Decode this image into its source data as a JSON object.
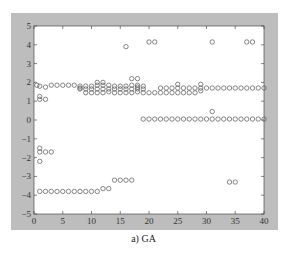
{
  "caption": "a) GA",
  "colors": {
    "panel": "#bdbdbd",
    "plot_bg": "#ffffff",
    "marker": "#555555",
    "axis": "#333333"
  },
  "chart_data": {
    "type": "scatter",
    "title": "",
    "caption": "a) GA",
    "xlabel": "",
    "ylabel": "",
    "xlim": [
      0,
      40
    ],
    "ylim": [
      -5,
      5
    ],
    "xticks": [
      0,
      5,
      10,
      15,
      20,
      25,
      30,
      35,
      40
    ],
    "yticks": [
      -5,
      -4,
      -3,
      -2,
      -1,
      0,
      1,
      2,
      3,
      4,
      5
    ],
    "grid": false,
    "legend": null,
    "marker": "open-circle",
    "series": [
      {
        "name": "upper-band-1.8",
        "points": [
          [
            0.5,
            1.85
          ],
          [
            1,
            1.8
          ],
          [
            2,
            1.75
          ],
          [
            3,
            1.85
          ],
          [
            4,
            1.85
          ],
          [
            5,
            1.85
          ],
          [
            6,
            1.85
          ],
          [
            7,
            1.85
          ],
          [
            8,
            1.8
          ],
          [
            8,
            1.7
          ],
          [
            9,
            1.8
          ],
          [
            10,
            1.8
          ],
          [
            11,
            1.85
          ],
          [
            11,
            2.0
          ],
          [
            12,
            2.0
          ],
          [
            12,
            1.85
          ],
          [
            13,
            1.85
          ],
          [
            14,
            1.8
          ],
          [
            15,
            1.8
          ],
          [
            16,
            1.8
          ],
          [
            17,
            1.85
          ],
          [
            17,
            2.2
          ],
          [
            18,
            2.2
          ],
          [
            18,
            1.85
          ],
          [
            19,
            1.8
          ]
        ]
      },
      {
        "name": "upper-band-1.6",
        "points": [
          [
            8,
            1.65
          ],
          [
            9,
            1.65
          ],
          [
            10,
            1.65
          ],
          [
            11,
            1.65
          ],
          [
            12,
            1.65
          ],
          [
            13,
            1.65
          ],
          [
            14,
            1.65
          ],
          [
            15,
            1.65
          ],
          [
            16,
            1.65
          ],
          [
            17,
            1.65
          ],
          [
            18,
            1.65
          ],
          [
            18,
            1.75
          ],
          [
            19,
            1.65
          ]
        ]
      },
      {
        "name": "upper-band-1.45",
        "points": [
          [
            9,
            1.45
          ],
          [
            10,
            1.45
          ],
          [
            11,
            1.45
          ],
          [
            12,
            1.45
          ],
          [
            13,
            1.5
          ],
          [
            14,
            1.45
          ],
          [
            15,
            1.45
          ],
          [
            16,
            1.45
          ],
          [
            17,
            1.45
          ],
          [
            18,
            1.5
          ],
          [
            19,
            1.45
          ],
          [
            20,
            1.45
          ],
          [
            21,
            1.45
          ],
          [
            22,
            1.45
          ],
          [
            23,
            1.45
          ],
          [
            24,
            1.45
          ],
          [
            25,
            1.45
          ],
          [
            26,
            1.45
          ],
          [
            27,
            1.45
          ],
          [
            28,
            1.45
          ],
          [
            29,
            1.55
          ]
        ]
      },
      {
        "name": "row-1.7",
        "points": [
          [
            22,
            1.7
          ],
          [
            23,
            1.7
          ],
          [
            24,
            1.7
          ],
          [
            25,
            1.7
          ],
          [
            25,
            1.9
          ],
          [
            26,
            1.7
          ],
          [
            27,
            1.7
          ],
          [
            28,
            1.7
          ],
          [
            29,
            1.7
          ],
          [
            29,
            1.9
          ],
          [
            30,
            1.7
          ],
          [
            31,
            1.7
          ],
          [
            32,
            1.7
          ],
          [
            33,
            1.7
          ],
          [
            34,
            1.7
          ],
          [
            35,
            1.7
          ],
          [
            36,
            1.7
          ],
          [
            37,
            1.7
          ],
          [
            38,
            1.7
          ],
          [
            39,
            1.7
          ],
          [
            40,
            1.7
          ]
        ]
      },
      {
        "name": "row-1.2",
        "points": [
          [
            1,
            1.25
          ],
          [
            1,
            1.1
          ],
          [
            2,
            1.1
          ]
        ]
      },
      {
        "name": "row-0.05",
        "points": [
          [
            19,
            0.05
          ],
          [
            20,
            0.05
          ],
          [
            21,
            0.05
          ],
          [
            22,
            0.05
          ],
          [
            23,
            0.05
          ],
          [
            24,
            0.05
          ],
          [
            25,
            0.05
          ],
          [
            26,
            0.05
          ],
          [
            27,
            0.05
          ],
          [
            28,
            0.05
          ],
          [
            29,
            0.05
          ],
          [
            30,
            0.05
          ],
          [
            31,
            0.05
          ],
          [
            31,
            0.45
          ],
          [
            32,
            0.05
          ],
          [
            33,
            0.05
          ],
          [
            34,
            0.05
          ],
          [
            35,
            0.05
          ],
          [
            36,
            0.05
          ],
          [
            37,
            0.05
          ],
          [
            38,
            0.05
          ],
          [
            39,
            0.05
          ],
          [
            40,
            0.05
          ]
        ]
      },
      {
        "name": "high-outliers",
        "points": [
          [
            16,
            3.9
          ],
          [
            20,
            4.15
          ],
          [
            21,
            4.15
          ],
          [
            31,
            4.15
          ],
          [
            37,
            4.15
          ],
          [
            38,
            4.15
          ]
        ]
      },
      {
        "name": "neg-1.6",
        "points": [
          [
            1,
            -1.5
          ],
          [
            1,
            -1.7
          ],
          [
            2,
            -1.7
          ],
          [
            3,
            -1.7
          ],
          [
            1,
            -2.2
          ]
        ]
      },
      {
        "name": "row-neg-3.8",
        "points": [
          [
            1,
            -3.8
          ],
          [
            2,
            -3.8
          ],
          [
            3,
            -3.8
          ],
          [
            4,
            -3.8
          ],
          [
            5,
            -3.8
          ],
          [
            6,
            -3.8
          ],
          [
            7,
            -3.8
          ],
          [
            8,
            -3.8
          ],
          [
            9,
            -3.8
          ],
          [
            10,
            -3.8
          ],
          [
            11,
            -3.8
          ],
          [
            12,
            -3.65
          ],
          [
            13,
            -3.65
          ],
          [
            14,
            -3.2
          ],
          [
            15,
            -3.2
          ],
          [
            16,
            -3.2
          ],
          [
            17,
            -3.2
          ],
          [
            34,
            -3.3
          ],
          [
            35,
            -3.3
          ]
        ]
      }
    ]
  }
}
